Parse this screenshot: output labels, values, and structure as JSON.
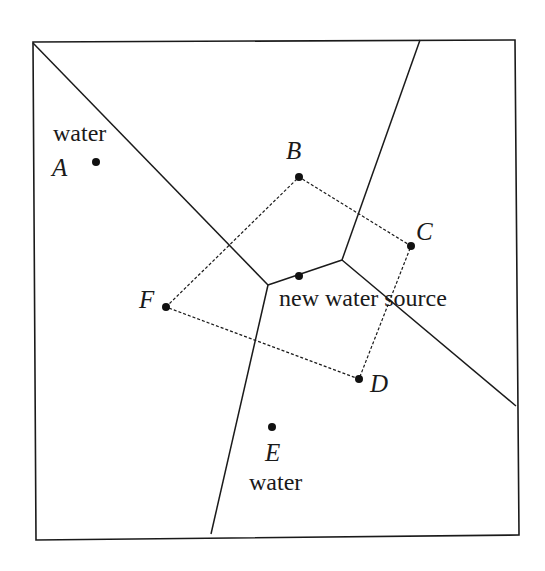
{
  "diagram": {
    "title": "",
    "colors": {
      "ink": "#1a1a1a",
      "background": "#ffffff"
    },
    "points": {
      "A": {
        "label": "A",
        "x": 96,
        "y": 162,
        "caption": "water"
      },
      "B": {
        "label": "B",
        "x": 299,
        "y": 177
      },
      "C": {
        "label": "C",
        "x": 411,
        "y": 246
      },
      "D": {
        "label": "D",
        "x": 359,
        "y": 379
      },
      "E": {
        "label": "E",
        "x": 272,
        "y": 427,
        "caption": "water"
      },
      "F": {
        "label": "F",
        "x": 166,
        "y": 307
      },
      "new_source": {
        "label": "new water source",
        "x": 299,
        "y": 276
      }
    },
    "region_boundaries": [
      {
        "from": [
          33,
          43
        ],
        "to": [
          268,
          285
        ]
      },
      {
        "from": [
          268,
          285
        ],
        "to": [
          342,
          260
        ]
      },
      {
        "from": [
          342,
          260
        ],
        "to": [
          420,
          40
        ]
      },
      {
        "from": [
          342,
          260
        ],
        "to": [
          516,
          406
        ]
      },
      {
        "from": [
          268,
          285
        ],
        "to": [
          211,
          534
        ]
      }
    ],
    "dashed_polygon": [
      "F",
      "B",
      "C",
      "D"
    ]
  }
}
